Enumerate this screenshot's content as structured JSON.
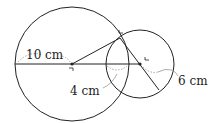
{
  "diagram": {
    "type": "intersecting-circles",
    "large_circle": {
      "label": "10 cm",
      "center": [
        72,
        64
      ],
      "radius": 57
    },
    "small_circle": {
      "label": "6 cm",
      "center": [
        140,
        64
      ],
      "radius": 34
    },
    "overlap": {
      "label": "4 cm"
    },
    "colors": {
      "stroke": "#222222",
      "dashed": "#888888",
      "background": "#ffffff"
    }
  },
  "labels": {
    "large_radius": "10 cm",
    "overlap": "4 cm",
    "small_radius": "6 cm"
  }
}
